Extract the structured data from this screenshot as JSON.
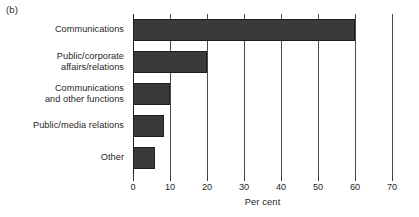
{
  "figure": {
    "panel_label": "(b)"
  },
  "chart_data": {
    "type": "bar",
    "orientation": "horizontal",
    "title": "",
    "subtitle": "",
    "xlabel": "Per cent",
    "ylabel": "",
    "xlim": [
      0,
      70
    ],
    "ylim": null,
    "xticks": [
      0,
      10,
      20,
      30,
      40,
      50,
      60,
      70
    ],
    "xtick_labels": [
      "0",
      "10",
      "20",
      "30",
      "40",
      "50",
      "60",
      "70"
    ],
    "grid": "vertical",
    "legend": null,
    "legend_position": "none",
    "bar_color": "#3a3a3a",
    "background_color": "#ffffff",
    "categories": [
      "Communications",
      "Public/corporate\naffairs/relations",
      "Communications\nand other functions",
      "Public/media relations",
      "Other"
    ],
    "values": [
      60,
      20,
      10,
      8.5,
      6
    ],
    "annotations": [
      "(b)"
    ]
  }
}
